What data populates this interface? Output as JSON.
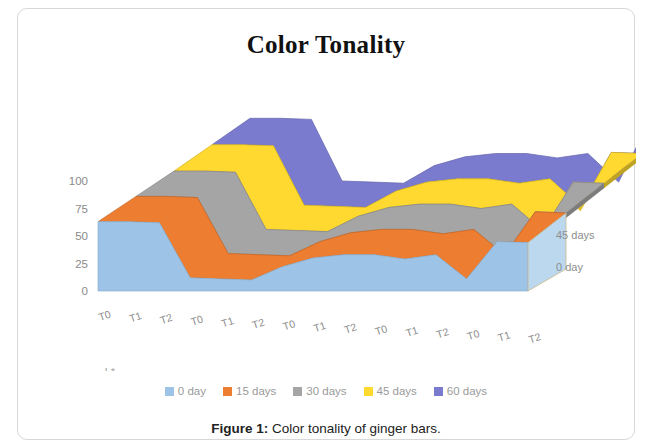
{
  "figure": {
    "title": "Color Tonality",
    "caption_label": "Figure 1:",
    "caption_text": " Color tonality of ginger bars."
  },
  "legend": {
    "items": [
      {
        "label": "0 day",
        "color": "#9DC3E6"
      },
      {
        "label": "15 days",
        "color": "#ED7D31"
      },
      {
        "label": "30 days",
        "color": "#A5A5A5"
      },
      {
        "label": "45 days",
        "color": "#FFD92F"
      },
      {
        "label": "60 days",
        "color": "#7A7ACF"
      }
    ]
  },
  "depth_axis": {
    "top_label": "45 days",
    "bottom_label": "0 day"
  },
  "chart_data": {
    "type": "area",
    "title": "Color Tonality",
    "xlabel": "",
    "ylabel": "",
    "ylim": [
      0,
      100
    ],
    "yticks": [
      0,
      25,
      50,
      75,
      100
    ],
    "grid": false,
    "legend_position": "bottom",
    "groups": [
      "L*",
      "a*",
      "b*",
      "Chroma",
      "Hue"
    ],
    "categories": [
      "T0",
      "T1",
      "T2",
      "T0",
      "T1",
      "T2",
      "T0",
      "T1",
      "T2",
      "T0",
      "T1",
      "T2",
      "T0",
      "T1",
      "T2"
    ],
    "series": [
      {
        "name": "0 day",
        "color": "#9DC3E6",
        "values": [
          63,
          63,
          62,
          12,
          11,
          10,
          22,
          30,
          33,
          33,
          29,
          33,
          11,
          45,
          44
        ]
      },
      {
        "name": "15 days",
        "color": "#ED7D31",
        "values": [
          66,
          66,
          65,
          14,
          13,
          12,
          25,
          33,
          36,
          36,
          32,
          36,
          13,
          52,
          51
        ]
      },
      {
        "name": "30 days",
        "color": "#A5A5A5",
        "values": [
          69,
          69,
          68,
          16,
          15,
          14,
          28,
          36,
          39,
          39,
          35,
          39,
          15,
          59,
          58
        ]
      },
      {
        "name": "45 days",
        "color": "#FFD92F",
        "values": [
          73,
          73,
          72,
          18,
          17,
          16,
          31,
          39,
          42,
          42,
          38,
          42,
          17,
          66,
          65
        ]
      },
      {
        "name": "60 days",
        "color": "#7A7ACF",
        "values": [
          77,
          77,
          76,
          20,
          19,
          18,
          34,
          42,
          45,
          45,
          41,
          45,
          19,
          74,
          73
        ]
      }
    ]
  }
}
